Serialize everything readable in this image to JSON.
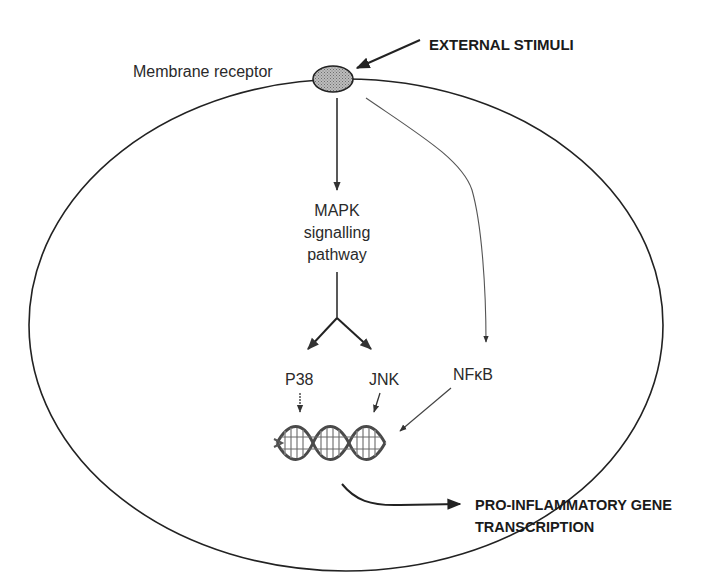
{
  "diagram": {
    "labels": {
      "external_stimuli": "EXTERNAL STIMULI",
      "membrane_receptor": "Membrane receptor",
      "mapk_line1": "MAPK",
      "mapk_line2": "signalling",
      "mapk_line3": "pathway",
      "p38": "P38",
      "jnk": "JNK",
      "nfkb": "NFκB",
      "output_line1": "PRO-INFLAMMATORY GENE",
      "output_line2": "TRANSCRIPTION"
    },
    "nodes": [
      {
        "id": "external_stimuli",
        "label": "EXTERNAL STIMULI"
      },
      {
        "id": "membrane_receptor",
        "label": "Membrane receptor"
      },
      {
        "id": "mapk",
        "label": "MAPK signalling pathway"
      },
      {
        "id": "p38",
        "label": "P38"
      },
      {
        "id": "jnk",
        "label": "JNK"
      },
      {
        "id": "nfkb",
        "label": "NFκB"
      },
      {
        "id": "dna",
        "label": "DNA"
      },
      {
        "id": "transcription",
        "label": "PRO-INFLAMMATORY GENE TRANSCRIPTION"
      }
    ],
    "edges": [
      {
        "from": "external_stimuli",
        "to": "membrane_receptor"
      },
      {
        "from": "membrane_receptor",
        "to": "mapk"
      },
      {
        "from": "membrane_receptor",
        "to": "nfkb"
      },
      {
        "from": "mapk",
        "to": "p38"
      },
      {
        "from": "mapk",
        "to": "jnk"
      },
      {
        "from": "p38",
        "to": "dna"
      },
      {
        "from": "jnk",
        "to": "dna"
      },
      {
        "from": "nfkb",
        "to": "dna"
      },
      {
        "from": "dna",
        "to": "transcription"
      }
    ],
    "colors": {
      "stroke": "#222222",
      "receptor_fill": "#a8a8a8",
      "dna": "#555555"
    }
  }
}
